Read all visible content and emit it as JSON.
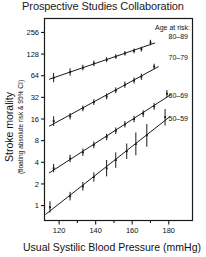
{
  "chart_data": {
    "type": "scatter",
    "title": "Prospective Studies Collaboration",
    "xlabel": "Usual Systilic Blood Pressure (mmHg)",
    "ylabel": "Stroke morality",
    "ylabel_sub": "(floating absolute risk & 95% CI)",
    "yscale": "log2",
    "ylim": [
      0.62,
      400
    ],
    "xlim": [
      112,
      193
    ],
    "grid": false,
    "legend_position": "right-inside",
    "legend_title": "Age at risk:",
    "y_ticks": [
      256,
      128,
      64,
      32,
      16,
      8,
      4,
      2,
      1
    ],
    "y_tick_labels": [
      "256",
      "128",
      "64",
      "32",
      "16",
      "8",
      "4",
      "2",
      "1"
    ],
    "x_ticks": [
      120,
      140,
      160,
      180
    ],
    "x_tick_labels": [
      "120",
      "140",
      "160",
      "180"
    ],
    "x_minor_ticks": [
      130,
      150,
      170
    ],
    "series": [
      {
        "name": "80-89",
        "label": "80–89",
        "color": "#1a1a1a",
        "x": [
          117,
          126,
          133,
          139,
          146,
          151,
          156,
          161,
          165,
          170
        ],
        "y": [
          60,
          72,
          83,
          95,
          107,
          118,
          131,
          142,
          150,
          185
        ],
        "y_lo": [
          52,
          64,
          76,
          87,
          99,
          110,
          122,
          131,
          139,
          170
        ],
        "y_hi": [
          70,
          81,
          91,
          104,
          116,
          127,
          141,
          153,
          162,
          202
        ]
      },
      {
        "name": "70-79",
        "label": "70–79",
        "color": "#1a1a1a",
        "x": [
          117,
          126,
          133,
          139,
          146,
          151,
          156,
          161,
          165,
          172
        ],
        "y": [
          15.0,
          17.5,
          22.5,
          27.5,
          33.0,
          40.0,
          48.0,
          55.0,
          62.0,
          86.0
        ],
        "y_lo": [
          12.8,
          15.8,
          20.5,
          25.0,
          30.0,
          36.5,
          43.5,
          50.0,
          56.0,
          79.0
        ],
        "y_hi": [
          17.5,
          19.4,
          24.7,
          30.2,
          36.3,
          44.0,
          53.0,
          60.5,
          68.5,
          94.0
        ]
      },
      {
        "name": "60-69",
        "label": "60–69",
        "color": "#1a1a1a",
        "x": [
          117,
          126,
          133,
          139,
          146,
          151,
          156,
          161,
          166,
          172,
          179
        ],
        "y": [
          3.3,
          4.5,
          5.5,
          7.0,
          9.0,
          11.0,
          13.5,
          16.0,
          19.0,
          24.0,
          36.0
        ],
        "y_lo": [
          2.9,
          4.0,
          4.9,
          6.3,
          8.1,
          9.9,
          12.2,
          14.4,
          17.0,
          21.5,
          32.0
        ],
        "y_hi": [
          3.8,
          5.1,
          6.2,
          7.8,
          10.0,
          12.2,
          15.0,
          17.8,
          21.2,
          26.8,
          40.5
        ]
      },
      {
        "name": "50-59",
        "label": "50–59",
        "color": "#1a1a1a",
        "x": [
          115,
          126,
          133,
          139,
          146,
          151,
          157,
          162,
          168,
          178
        ],
        "y": [
          0.95,
          1.35,
          1.85,
          2.5,
          3.3,
          4.3,
          5.7,
          7.2,
          9.5,
          17.0
        ],
        "y_lo": [
          0.8,
          1.18,
          1.62,
          2.15,
          2.55,
          3.35,
          4.45,
          5.0,
          6.6,
          13.0
        ],
        "y_hi": [
          1.15,
          1.55,
          2.12,
          2.9,
          4.3,
          5.5,
          7.3,
          10.4,
          13.6,
          22.0
        ]
      }
    ]
  },
  "legend": {
    "title": "Age at risk:",
    "entries": [
      {
        "label": "80–89"
      },
      {
        "label": "70–79"
      },
      {
        "label": "60–69"
      },
      {
        "label": "50–59"
      }
    ]
  }
}
